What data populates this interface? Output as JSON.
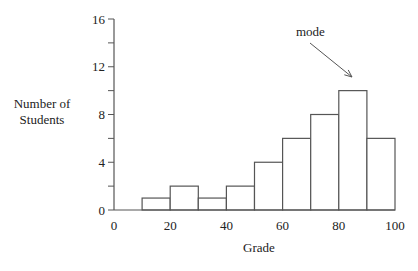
{
  "chart_data": {
    "type": "bar",
    "title": "",
    "xlabel": "Grade",
    "ylabel": "Number of Students",
    "ylabel_lines": [
      "Number of",
      "Students"
    ],
    "bins": [
      [
        10,
        20
      ],
      [
        20,
        30
      ],
      [
        30,
        40
      ],
      [
        40,
        50
      ],
      [
        50,
        60
      ],
      [
        60,
        70
      ],
      [
        70,
        80
      ],
      [
        80,
        90
      ],
      [
        90,
        100
      ]
    ],
    "categories": [
      "10-20",
      "20-30",
      "30-40",
      "40-50",
      "50-60",
      "60-70",
      "70-80",
      "80-90",
      "90-100"
    ],
    "values": [
      1,
      2,
      1,
      2,
      4,
      6,
      8,
      10,
      6
    ],
    "xlim": [
      0,
      100
    ],
    "ylim": [
      0,
      16
    ],
    "xticks": [
      "0",
      "20",
      "40",
      "60",
      "80",
      "100"
    ],
    "yticks": [
      "0",
      "4",
      "8",
      "12",
      "16"
    ],
    "grid": false,
    "annotation": {
      "text": "mode",
      "points_to_bin": "80-90"
    }
  }
}
